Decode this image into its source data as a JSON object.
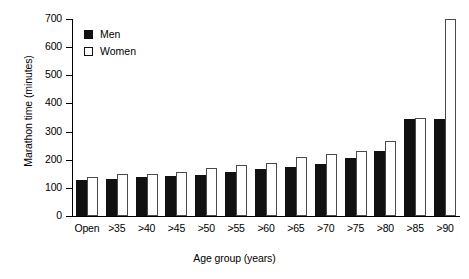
{
  "chart_data": {
    "type": "bar",
    "title": "",
    "xlabel": "Age group (years)",
    "ylabel": "Marathon time (minutes)",
    "categories": [
      "Open",
      ">35",
      ">40",
      ">45",
      ">50",
      ">55",
      ">60",
      ">65",
      ">70",
      ">75",
      ">80",
      ">85",
      ">90"
    ],
    "series": [
      {
        "name": "Men",
        "color": "#111111",
        "values": [
          128,
          132,
          140,
          143,
          146,
          157,
          168,
          174,
          185,
          205,
          232,
          345,
          345
        ]
      },
      {
        "name": "Women",
        "color": "#ffffff",
        "values": [
          139,
          149,
          150,
          157,
          170,
          180,
          190,
          211,
          222,
          231,
          265,
          348,
          420
        ]
      }
    ],
    "ylim": [
      0,
      700
    ],
    "yticks": [
      0,
      100,
      200,
      300,
      400,
      500,
      600,
      700
    ],
    "ytick_labels": [
      "0",
      "100",
      "200",
      "300",
      "400",
      "500",
      "600",
      "700"
    ],
    "grid": false,
    "legend_position": "top-left",
    "note_last_women_value": 700
  },
  "legend": {
    "items": [
      {
        "label": "Men",
        "swatch": "filled-square"
      },
      {
        "label": "Women",
        "swatch": "open-square"
      }
    ]
  }
}
